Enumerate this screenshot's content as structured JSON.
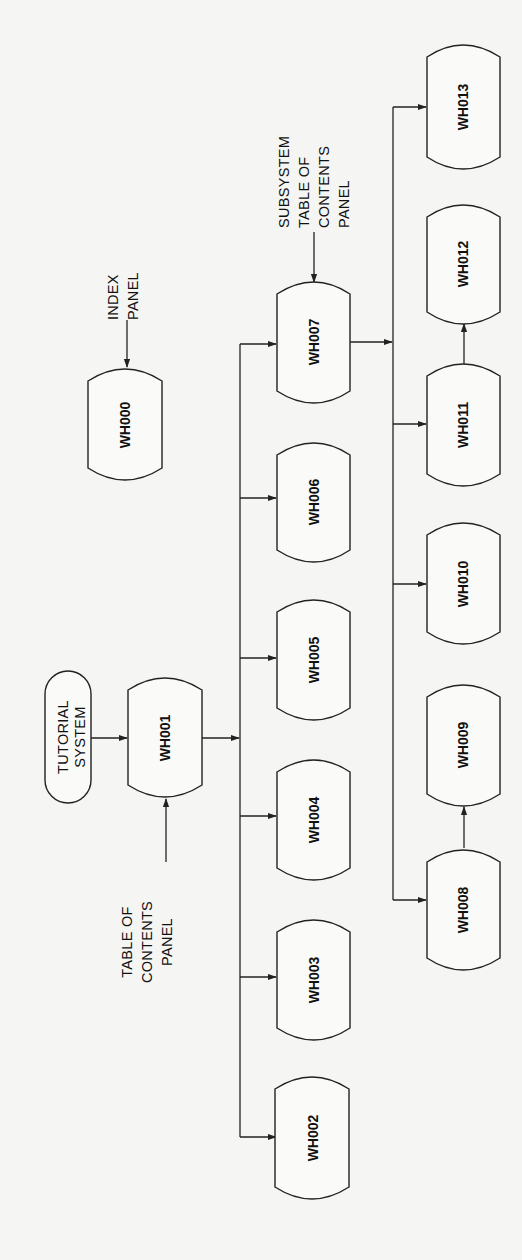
{
  "diagram": {
    "type": "flowchart",
    "orientation": "rotated-90-ccw",
    "start": {
      "id": "tutorial-system",
      "lines": [
        "TUTORIAL",
        "SYSTEM"
      ]
    },
    "annotations": {
      "toc_panel": {
        "lines": [
          "TABLE OF",
          "CONTENTS",
          "PANEL"
        ],
        "target": "WH001"
      },
      "index_panel": {
        "lines": [
          "INDEX",
          "PANEL"
        ],
        "target": "WH000"
      },
      "subsystem_toc_panel": {
        "lines": [
          "SUBSYSTEM",
          "TABLE OF",
          "CONTENTS",
          "PANEL"
        ],
        "target": "WH007"
      }
    },
    "nodes": {
      "wh000": "WH000",
      "wh001": "WH001",
      "wh002": "WH002",
      "wh003": "WH003",
      "wh004": "WH004",
      "wh005": "WH005",
      "wh006": "WH006",
      "wh007": "WH007",
      "wh008": "WH008",
      "wh009": "WH009",
      "wh010": "WH010",
      "wh011": "WH011",
      "wh012": "WH012",
      "wh013": "WH013"
    },
    "edges": [
      [
        "TUTORIAL SYSTEM",
        "WH001"
      ],
      [
        "TABLE OF CONTENTS PANEL",
        "WH001"
      ],
      [
        "INDEX PANEL",
        "WH000"
      ],
      [
        "WH001",
        "WH002"
      ],
      [
        "WH001",
        "WH003"
      ],
      [
        "WH001",
        "WH004"
      ],
      [
        "WH001",
        "WH005"
      ],
      [
        "WH001",
        "WH006"
      ],
      [
        "WH001",
        "WH007"
      ],
      [
        "SUBSYSTEM TABLE OF CONTENTS PANEL",
        "WH007"
      ],
      [
        "WH007",
        "WH008"
      ],
      [
        "WH007",
        "WH010"
      ],
      [
        "WH007",
        "WH011"
      ],
      [
        "WH007",
        "WH013"
      ],
      [
        "WH008",
        "WH009"
      ],
      [
        "WH011",
        "WH012"
      ]
    ]
  }
}
